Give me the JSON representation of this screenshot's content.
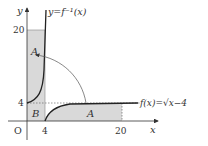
{
  "labels": {
    "y_axis": "y",
    "x_axis": "x",
    "origin": "O",
    "inverse_fn": "y=f⁻¹(x)",
    "fn": "f(x)=√x−4",
    "region_a_top": "A",
    "region_a_bottom": "A",
    "region_b": "B",
    "tick_x_4": "4",
    "tick_x_20": "20",
    "tick_y_4": "4",
    "tick_y_20": "20"
  },
  "colors": {
    "shade": "#d9d9d9",
    "curve": "#222222",
    "axis": "#333333"
  }
}
